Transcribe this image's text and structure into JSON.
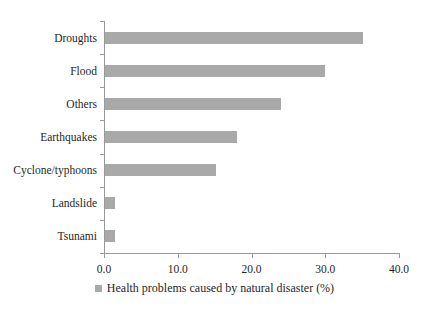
{
  "chart_data": {
    "type": "bar",
    "orientation": "horizontal",
    "title": "",
    "categories": [
      "Droughts",
      "Flood",
      "Others",
      "Earthquakes",
      "Cyclone/typhoons",
      "Landslide",
      "Tsunami"
    ],
    "values": [
      35.0,
      29.8,
      23.9,
      17.9,
      15.1,
      1.3,
      1.3
    ],
    "series": [
      {
        "name": "Health problems caused by natural disaster (%)",
        "values": [
          35.0,
          29.8,
          23.9,
          17.9,
          15.1,
          1.3,
          1.3
        ]
      }
    ],
    "xlabel": "",
    "ylabel": "",
    "xlim": [
      0,
      40
    ],
    "xticks": [
      0,
      10,
      20,
      30,
      40
    ],
    "xtick_labels": [
      "0.0",
      "10.0",
      "20.0",
      "30.0",
      "40.0"
    ],
    "grid": false,
    "legend": {
      "label": "Health problems caused by natural disaster (%)",
      "position": "bottom",
      "marker_color": "#a9a9a9"
    },
    "bar_color": "#a9a9a9",
    "axis_color": "#999999",
    "text_color": "#1f1f1f",
    "background_color": "#ffffff"
  }
}
